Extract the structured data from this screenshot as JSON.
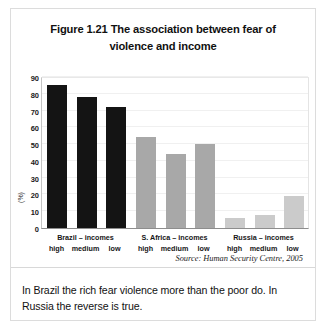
{
  "figure": {
    "title": "Figure 1.21 The association between fear of violence and income",
    "source": "Source: Human Security Centre, 2005",
    "caption": "In Brazil the rich fear violence more than the poor do. In Russia the reverse is true."
  },
  "chart_data": {
    "type": "bar",
    "title": "Figure 1.21 The association between fear of violence and income",
    "xlabel": "",
    "ylabel": "(%)",
    "ylim": [
      0,
      90
    ],
    "yticks": [
      0,
      10,
      20,
      30,
      40,
      50,
      60,
      70,
      80,
      90
    ],
    "grid": true,
    "legend": "none",
    "categories": [
      "high",
      "medium",
      "low"
    ],
    "groups": [
      {
        "name": "Brazil – incomes",
        "color": "#141414",
        "values": [
          85,
          78,
          72
        ]
      },
      {
        "name": "S. Africa – incomes",
        "color": "#a8a8a8",
        "values": [
          54,
          44,
          50
        ]
      },
      {
        "name": "Russia – incomes",
        "color": "#cbcbcb",
        "values": [
          6,
          8,
          19
        ]
      }
    ],
    "bars": [
      {
        "group": "Brazil – incomes",
        "category": "high",
        "value": 85,
        "color": "#141414"
      },
      {
        "group": "Brazil – incomes",
        "category": "medium",
        "value": 78,
        "color": "#141414"
      },
      {
        "group": "Brazil – incomes",
        "category": "low",
        "value": 72,
        "color": "#141414"
      },
      {
        "group": "S. Africa – incomes",
        "category": "high",
        "value": 54,
        "color": "#a8a8a8"
      },
      {
        "group": "S. Africa – incomes",
        "category": "medium",
        "value": 44,
        "color": "#a8a8a8"
      },
      {
        "group": "S. Africa – incomes",
        "category": "low",
        "value": 50,
        "color": "#a8a8a8"
      },
      {
        "group": "Russia – incomes",
        "category": "high",
        "value": 6,
        "color": "#cbcbcb"
      },
      {
        "group": "Russia – incomes",
        "category": "medium",
        "value": 8,
        "color": "#cbcbcb"
      },
      {
        "group": "Russia – incomes",
        "category": "low",
        "value": 19,
        "color": "#cbcbcb"
      }
    ]
  }
}
